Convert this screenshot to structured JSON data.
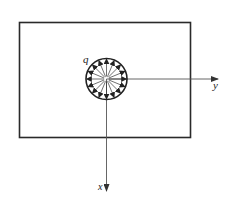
{
  "diagram": {
    "title": "",
    "plate": {
      "x": 19.5,
      "y": 22.5,
      "width": 171,
      "height": 115,
      "stroke": "#2a2a2a"
    },
    "hole": {
      "cx": 106.5,
      "cy": 79,
      "r": 20.5,
      "label": "q",
      "label_pos": {
        "x": 83,
        "y": 63
      },
      "arrow_count": 16,
      "arrow_direction": "outward",
      "stroke": "#222222"
    },
    "axes": {
      "y_axis": {
        "label": "y",
        "from": [
          106.5,
          79
        ],
        "to": [
          218,
          79
        ],
        "label_pos": {
          "x": 213,
          "y": 89
        }
      },
      "x_axis": {
        "label": "x",
        "from": [
          106.5,
          79
        ],
        "to": [
          106.5,
          191
        ],
        "label_pos": {
          "x": 98,
          "y": 190
        }
      },
      "stroke": "#555555"
    }
  }
}
